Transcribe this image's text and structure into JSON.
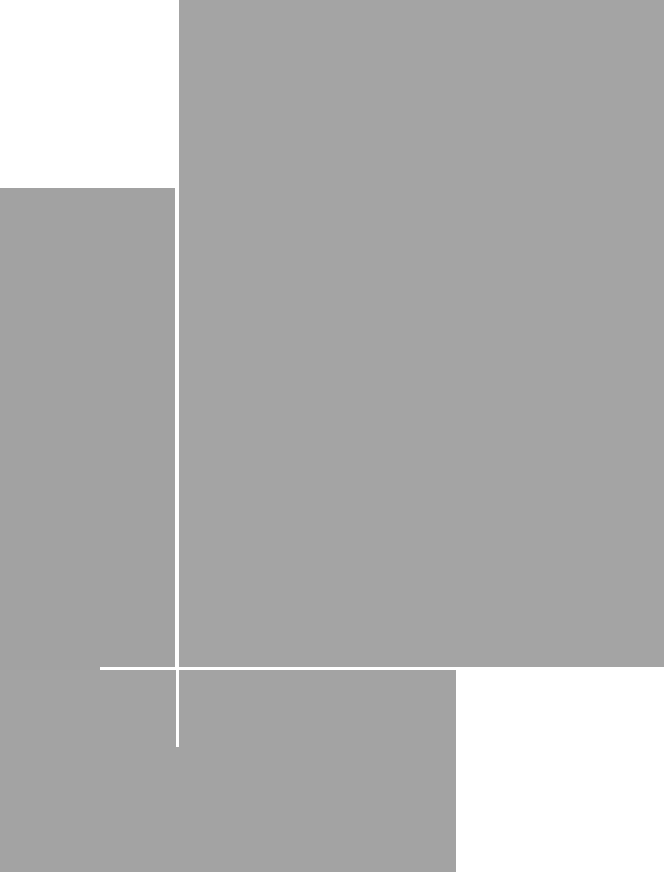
{
  "canvas": {
    "width": 664,
    "height": 872,
    "background": "#ffffff"
  },
  "colors": {
    "gray": "#a3a3a3",
    "gray_dark": "#a0a0a0",
    "line": "#ffffff"
  },
  "shapes": [
    {
      "name": "large-gray-rectangle",
      "x": 179,
      "y": 0,
      "w": 485,
      "h": 667,
      "color": "#a4a4a4"
    },
    {
      "name": "left-gray-block",
      "x": 0,
      "y": 188,
      "w": 175,
      "h": 684,
      "color": "#a2a2a2"
    },
    {
      "name": "lower-gray-band",
      "x": 0,
      "y": 670,
      "w": 456,
      "h": 202,
      "color": "#a3a3a3"
    },
    {
      "name": "bottom-right-white-area",
      "x": 456,
      "y": 668,
      "w": 208,
      "h": 204,
      "color": "#ffffff"
    }
  ],
  "lines": [
    {
      "name": "vertical-white-line",
      "x": 176,
      "y": 0,
      "w": 3,
      "h": 747,
      "color": "#ffffff"
    },
    {
      "name": "horizontal-white-line",
      "x": 100,
      "y": 667,
      "w": 564,
      "h": 3,
      "color": "#ffffff"
    }
  ]
}
